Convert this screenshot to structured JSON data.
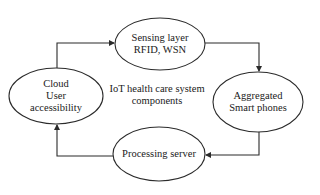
{
  "diagram": {
    "title": [
      "IoT health care system",
      "components"
    ],
    "nodes": [
      {
        "id": "sensing",
        "lines": [
          "Sensing layer",
          "RFID, WSN"
        ],
        "cx": 160,
        "cy": 44,
        "rx": 45,
        "ry": 26
      },
      {
        "id": "aggregated",
        "lines": [
          "Aggregated",
          "Smart phones"
        ],
        "cx": 258,
        "cy": 102,
        "rx": 45,
        "ry": 30
      },
      {
        "id": "processing",
        "lines": [
          "Processing server"
        ],
        "cx": 159,
        "cy": 154,
        "rx": 46,
        "ry": 27
      },
      {
        "id": "cloud",
        "lines": [
          "Cloud",
          "User",
          "accessibility"
        ],
        "cx": 56,
        "cy": 96,
        "rx": 47,
        "ry": 28
      }
    ],
    "edges": [
      {
        "from": "cloud",
        "to": "sensing"
      },
      {
        "from": "sensing",
        "to": "aggregated"
      },
      {
        "from": "aggregated",
        "to": "processing"
      },
      {
        "from": "processing",
        "to": "cloud"
      }
    ],
    "colors": {
      "stroke": "#2b2b2b",
      "text": "#1a1a1a",
      "background": "#ffffff"
    }
  }
}
